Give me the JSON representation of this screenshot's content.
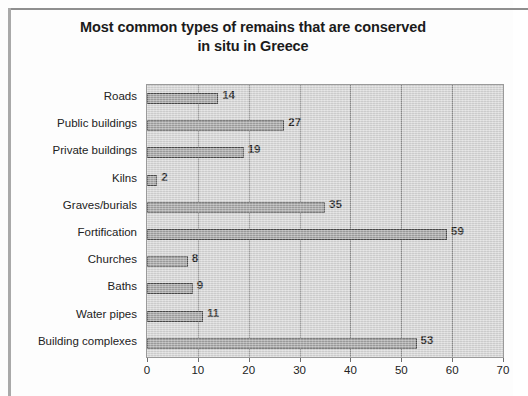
{
  "chart_data": {
    "type": "bar",
    "orientation": "horizontal",
    "title": "Most common types of remains that are conserved in situ in Greece",
    "title_lines": [
      "Most common types of remains that are conserved",
      "in situ in Greece"
    ],
    "categories": [
      "Roads",
      "Public buildings",
      "Private buildings",
      "Kilns",
      "Graves/burials",
      "Fortification",
      "Churches",
      "Baths",
      "Water pipes",
      "Building complexes"
    ],
    "values": [
      14,
      27,
      19,
      2,
      35,
      59,
      8,
      9,
      11,
      53
    ],
    "data_labels": [
      "14",
      "27",
      "19",
      "2",
      "35",
      "59",
      "8",
      "9",
      "11",
      "53"
    ],
    "xlabel": "",
    "ylabel": "",
    "xlim": [
      0,
      70
    ],
    "xticks": [
      0,
      10,
      20,
      30,
      40,
      50,
      60,
      70
    ],
    "xtick_labels": [
      "0",
      "10",
      "20",
      "30",
      "40",
      "50",
      "60",
      "70"
    ],
    "grid": "vertical",
    "legend": null,
    "series": [
      {
        "name": "Count",
        "values": [
          14,
          27,
          19,
          2,
          35,
          59,
          8,
          9,
          11,
          53
        ]
      }
    ],
    "colors": {
      "bar_fill": "#a2a2a2",
      "bar_border": "#4a4a4a",
      "plot_background": "#d6d6d6",
      "gridline": "#8d8d8d",
      "text": "#222222",
      "frame": "#8e8e8e"
    }
  }
}
